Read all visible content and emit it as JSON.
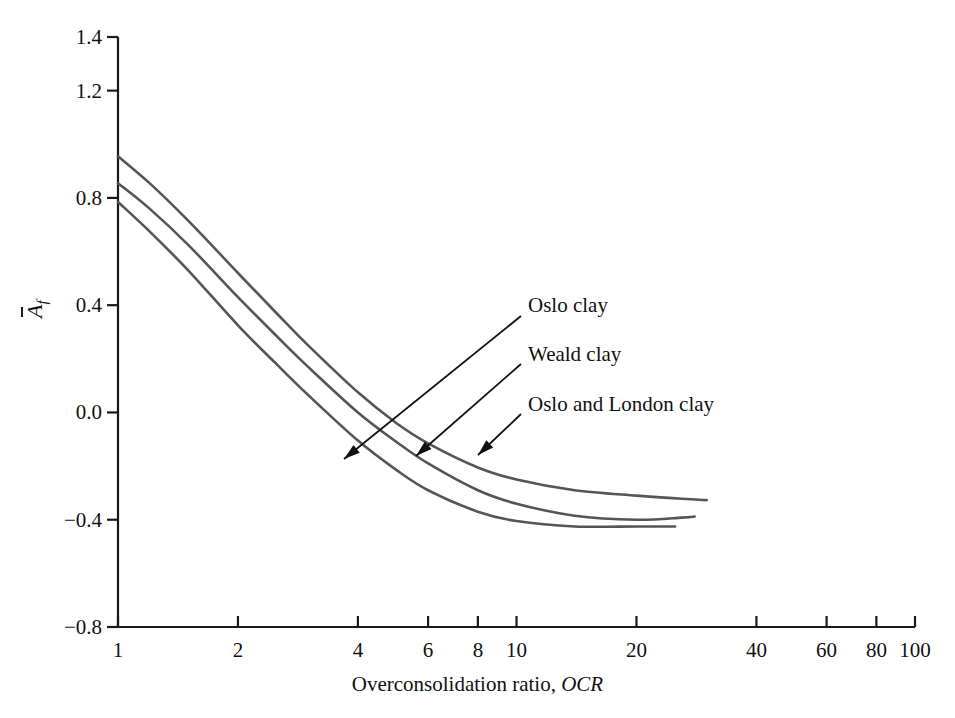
{
  "chart_data": {
    "type": "line",
    "title": "",
    "xlabel": "Overconsolidation ratio, OCR",
    "xlabel_plain": "Overconsolidation ratio,",
    "xlabel_italic": "OCR",
    "ylabel": "Āf",
    "xscale": "log",
    "xlim": [
      1,
      100
    ],
    "ylim": [
      -0.8,
      1.4
    ],
    "grid": false,
    "legend": "inline-annotations",
    "xticks": [
      1,
      2,
      4,
      6,
      8,
      10,
      20,
      40,
      60,
      80,
      100
    ],
    "xtick_labels": [
      "1",
      "2",
      "4",
      "6",
      "8",
      "10",
      "20",
      "40",
      "60",
      "80",
      "100"
    ],
    "yticks": [
      -0.8,
      -0.4,
      0.0,
      0.4,
      0.8,
      1.2,
      1.4
    ],
    "ytick_labels": [
      "-0.8",
      "-0.4",
      "0.0",
      "0.4",
      "0.8",
      "1.2",
      "1.4"
    ],
    "line_color": "#555555",
    "series": [
      {
        "name": "Oslo clay",
        "x": [
          1.0,
          1.2,
          1.5,
          2.0,
          2.5,
          3.0,
          4.0,
          5.0,
          6.0,
          8.0,
          10.0,
          14.0,
          20.0,
          26.0,
          30.0
        ],
        "y": [
          0.955,
          0.855,
          0.715,
          0.52,
          0.37,
          0.25,
          0.075,
          -0.04,
          -0.115,
          -0.205,
          -0.25,
          -0.29,
          -0.31,
          -0.322,
          -0.327
        ]
      },
      {
        "name": "Weald clay",
        "x": [
          1.0,
          1.2,
          1.5,
          2.0,
          2.5,
          3.0,
          4.0,
          5.0,
          6.0,
          8.0,
          10.0,
          14.0,
          20.0,
          26.0,
          28.0
        ],
        "y": [
          0.855,
          0.76,
          0.625,
          0.43,
          0.285,
          0.17,
          0.0,
          -0.11,
          -0.19,
          -0.29,
          -0.34,
          -0.385,
          -0.4,
          -0.392,
          -0.388
        ]
      },
      {
        "name": "Oslo and London clay",
        "x": [
          1.0,
          1.2,
          1.5,
          2.0,
          2.5,
          3.0,
          4.0,
          5.0,
          6.0,
          8.0,
          10.0,
          14.0,
          20.0,
          25.0
        ],
        "y": [
          0.785,
          0.675,
          0.53,
          0.325,
          0.18,
          0.065,
          -0.105,
          -0.215,
          -0.29,
          -0.37,
          -0.405,
          -0.425,
          -0.425,
          -0.425
        ]
      }
    ],
    "annotations": [
      {
        "text": "Oslo clay",
        "label_x": 528,
        "label_y": 307,
        "arrow_from_x": 521,
        "arrow_from_y": 316,
        "arrow_to_x": 344,
        "arrow_to_y": 459
      },
      {
        "text": "Weald clay",
        "label_x": 528,
        "label_y": 356,
        "arrow_from_x": 521,
        "arrow_from_y": 364,
        "arrow_to_x": 416,
        "arrow_to_y": 456
      },
      {
        "text": "Oslo and London clay",
        "label_x": 528,
        "label_y": 406,
        "arrow_from_x": 521,
        "arrow_from_y": 414,
        "arrow_to_x": 478,
        "arrow_to_y": 455
      }
    ]
  },
  "axes": {
    "y_title_letter": "A",
    "y_title_sub": "f"
  }
}
